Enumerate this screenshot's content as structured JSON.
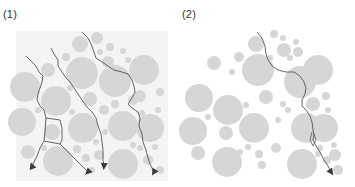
{
  "figure": {
    "panels": [
      {
        "label": "(1)",
        "description": "multiple cracks with branching, propagating around aggregates",
        "crack_count": 4
      },
      {
        "label": "(2)",
        "description": "single dominant crack propagating around aggregates",
        "crack_count": 1
      }
    ],
    "colors": {
      "aggregate": "#d6d6d6",
      "matrix_panel_1": "#f4f4f4",
      "crack": "#555555",
      "background": "#ffffff"
    }
  }
}
